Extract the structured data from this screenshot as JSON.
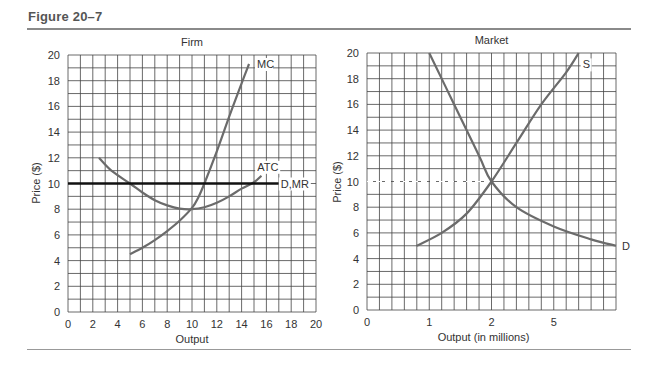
{
  "figure": {
    "title": "Figure 20–7"
  },
  "chart_data": [
    {
      "type": "line",
      "title": "Firm",
      "xlabel": "Output",
      "ylabel": "Price ($)",
      "xlim": [
        0,
        20
      ],
      "ylim": [
        0,
        20
      ],
      "grid": true,
      "x_ticks": [
        "0",
        "2",
        "4",
        "6",
        "8",
        "10",
        "12",
        "14",
        "16",
        "18",
        "20"
      ],
      "y_ticks": [
        "0",
        "2",
        "4",
        "6",
        "8",
        "10",
        "12",
        "14",
        "16",
        "18",
        "20"
      ],
      "series": [
        {
          "name": "MC",
          "points": [
            [
              5,
              4.5
            ],
            [
              6,
              5
            ],
            [
              7,
              5.6
            ],
            [
              8,
              6.3
            ],
            [
              9,
              7.1
            ],
            [
              10,
              8.1
            ],
            [
              10.5,
              8.9
            ],
            [
              11,
              10
            ],
            [
              12,
              12.5
            ],
            [
              13,
              15.2
            ],
            [
              14,
              17.8
            ],
            [
              14.6,
              19.3
            ]
          ]
        },
        {
          "name": "ATC",
          "points": [
            [
              2.5,
              12
            ],
            [
              3.5,
              11
            ],
            [
              5,
              10
            ],
            [
              6,
              9.3
            ],
            [
              7,
              8.7
            ],
            [
              8,
              8.3
            ],
            [
              9,
              8.05
            ],
            [
              10,
              8
            ],
            [
              11,
              8.15
            ],
            [
              12,
              8.5
            ],
            [
              13,
              9
            ],
            [
              14,
              9.6
            ],
            [
              15,
              10.1
            ],
            [
              15.6,
              10.6
            ]
          ]
        },
        {
          "name": "D,MR",
          "points": [
            [
              0,
              10
            ],
            [
              17,
              10
            ]
          ]
        }
      ],
      "annotations": [
        "MC",
        "ATC",
        "D,MR"
      ]
    },
    {
      "type": "line",
      "title": "Market",
      "xlabel": "Output (in millions)",
      "ylabel": "Price ($)",
      "ylim": [
        0,
        20
      ],
      "grid": true,
      "x_ticks": [
        "0",
        "1",
        "2",
        "5"
      ],
      "y_ticks": [
        "0",
        "2",
        "4",
        "6",
        "8",
        "10",
        "12",
        "14",
        "16",
        "18",
        "20"
      ],
      "series": [
        {
          "name": "S",
          "points": [
            [
              0.8,
              5
            ],
            [
              1.2,
              6
            ],
            [
              1.6,
              7.5
            ],
            [
              2,
              10
            ],
            [
              2.4,
              13
            ],
            [
              2.8,
              16
            ],
            [
              3.2,
              18.5
            ],
            [
              3.4,
              20
            ]
          ]
        },
        {
          "name": "D",
          "points": [
            [
              1.0,
              20
            ],
            [
              1.4,
              16
            ],
            [
              1.8,
              12
            ],
            [
              2,
              10
            ],
            [
              2.4,
              8
            ],
            [
              3,
              6.5
            ],
            [
              3.6,
              5.5
            ],
            [
              4.0,
              5
            ]
          ]
        }
      ],
      "equilibrium": {
        "quantity": "2",
        "price": 10
      },
      "annotations": [
        "S",
        "D"
      ]
    }
  ],
  "labels": {
    "firm_title": "Firm",
    "market_title": "Market",
    "firm_xlabel": "Output",
    "market_xlabel": "Output (in millions)",
    "ylabel": "Price ($)",
    "mc": "MC",
    "atc": "ATC",
    "dmr": "D,MR",
    "s": "S",
    "d": "D"
  }
}
